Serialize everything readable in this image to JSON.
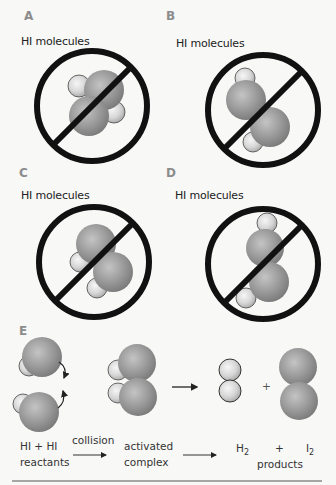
{
  "panels": [
    {
      "letter": "A",
      "caption": "HI molecules",
      "status": "prohibited"
    },
    {
      "letter": "B",
      "caption": "HI molecules",
      "status": "prohibited"
    },
    {
      "letter": "C",
      "caption": "HI molecules",
      "status": "prohibited"
    },
    {
      "letter": "D",
      "caption": "HI molecules",
      "status": "prohibited"
    }
  ],
  "panel_e": {
    "letter": "E",
    "reactants_formula": "HI + HI",
    "reactants_label": "reactants",
    "step1_label": "collision",
    "intermediate_line1": "activated",
    "intermediate_line2": "complex",
    "product1": "H",
    "product1_sub": "2",
    "plus": "+",
    "product2": "I",
    "product2_sub": "2",
    "products_label": "products",
    "diagram_plus": "+"
  },
  "colors": {
    "iodine_atom": "#9a9a9a",
    "hydrogen_atom": "#d9d9d9",
    "prohibition_sign": "#111111",
    "letter_label": "#8c8c8c"
  }
}
